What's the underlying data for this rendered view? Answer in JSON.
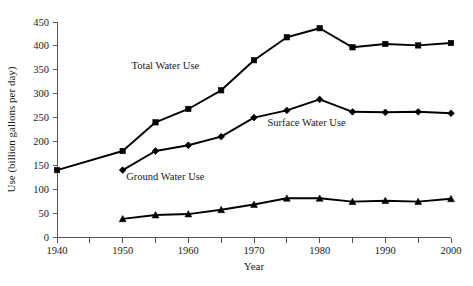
{
  "chart_data": {
    "type": "line",
    "title": "",
    "xlabel": "Year",
    "ylabel": "Use (billion gallons per day)",
    "xlim": [
      1940,
      2000
    ],
    "ylim": [
      0,
      450
    ],
    "grid": false,
    "legend_position": "inline-annotations",
    "x_tick_values": [
      1940,
      1945,
      1950,
      1955,
      1960,
      1965,
      1970,
      1975,
      1980,
      1985,
      1990,
      1995,
      2000
    ],
    "x_tick_labels": [
      "1940",
      "",
      "1950",
      "",
      "1960",
      "",
      "1970",
      "",
      "1980",
      "",
      "1990",
      "",
      "2000"
    ],
    "y_tick_values": [
      0,
      50,
      100,
      150,
      200,
      250,
      300,
      350,
      400,
      450
    ],
    "y_tick_labels": [
      "0",
      "50",
      "100",
      "150",
      "200",
      "250",
      "300",
      "350",
      "400",
      "450"
    ],
    "series": [
      {
        "name": "Total Water Use",
        "marker": "square",
        "color": "#000000",
        "annotation": "Total Water Use",
        "annotation_xy": [
          1956.5,
          352
        ],
        "x": [
          1940,
          1950,
          1955,
          1960,
          1965,
          1970,
          1975,
          1980,
          1985,
          1990,
          1995,
          2000
        ],
        "values": [
          140,
          180,
          240,
          268,
          307,
          370,
          418,
          437,
          397,
          404,
          401,
          406
        ]
      },
      {
        "name": "Surface Water Use",
        "marker": "diamond",
        "color": "#000000",
        "annotation": "Surface Water Use",
        "annotation_xy": [
          1978,
          232
        ],
        "x": [
          1950,
          1955,
          1960,
          1965,
          1970,
          1975,
          1980,
          1985,
          1990,
          1995,
          2000
        ],
        "values": [
          140,
          180,
          192,
          210,
          250,
          265,
          288,
          262,
          261,
          262,
          259
        ]
      },
      {
        "name": "Ground Water Use",
        "marker": "triangle",
        "color": "#000000",
        "annotation": "Ground Water Use",
        "annotation_xy": [
          1956.5,
          120
        ],
        "x": [
          1950,
          1955,
          1960,
          1965,
          1970,
          1975,
          1980,
          1985,
          1990,
          1995,
          2000
        ],
        "values": [
          38,
          46,
          48,
          57,
          68,
          81,
          81,
          74,
          76,
          74,
          80
        ]
      }
    ]
  },
  "axes": {
    "x_title": "Year",
    "y_title": "Use (billion gallons per day)"
  },
  "colors": {
    "series": "#000000",
    "axis": "#555555",
    "text": "#1a1a1a",
    "background": "#ffffff"
  }
}
